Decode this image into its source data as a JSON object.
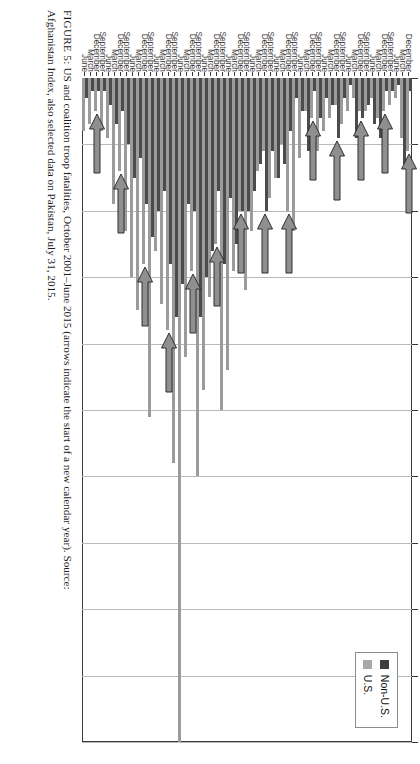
{
  "figure": {
    "caption_prefix": "FIGURE 5:",
    "caption_line1": " US and coalition troop fatalities, October 2001–June 2015 (arrows indicate the start of a new calendar year). Source:",
    "caption_line2": "Afghanistan Index, also selected data on Pakistan, July 31, 2015."
  },
  "legend": {
    "position": "top-right",
    "items": [
      {
        "label": "Non-U.S.",
        "color": "#3f3f3f",
        "key": "nonus"
      },
      {
        "label": "U.S.",
        "color": "#a7a7a7",
        "key": "us"
      }
    ]
  },
  "annotations": {
    "arrow_note": "arrows indicate the start of a new calendar year",
    "arrow_categories": [
      0,
      4,
      8,
      12,
      16,
      20,
      24,
      28,
      32,
      36,
      40,
      44,
      48,
      52
    ]
  },
  "chart_data": {
    "type": "bar",
    "orientation": "horizontal",
    "title": "US and coalition troop fatalities, October 2001–June 2015",
    "xlabel": "",
    "ylabel": "",
    "xlim": [
      0,
      100
    ],
    "xticks": [
      0,
      10,
      20,
      30,
      40,
      50,
      60,
      70,
      80,
      90,
      100
    ],
    "grid": true,
    "legend_position": "top-right",
    "categories": [
      "December",
      "March",
      "June",
      "September",
      "December",
      "March",
      "June",
      "September",
      "December",
      "March",
      "June",
      "September",
      "December",
      "March",
      "June",
      "September",
      "December",
      "March",
      "June",
      "September",
      "December",
      "March",
      "June",
      "September",
      "December",
      "March",
      "June",
      "September",
      "December",
      "March",
      "June",
      "September",
      "December",
      "March",
      "June",
      "September",
      "December",
      "March",
      "June",
      "September",
      "December",
      "March",
      "June",
      "September",
      "December",
      "March",
      "June",
      "September",
      "December",
      "March",
      "June",
      "September",
      "December",
      "March",
      "June"
    ],
    "series": [
      {
        "name": "U.S.",
        "color": "#9b9b9b",
        "values": [
          11,
          9,
          3,
          4,
          5,
          6,
          3,
          5,
          5,
          3,
          5,
          7,
          4,
          6,
          8,
          11,
          6,
          5,
          12,
          23,
          20,
          10,
          15,
          18,
          11,
          14,
          23,
          32,
          20,
          29,
          44,
          50,
          25,
          33,
          47,
          60,
          29,
          42,
          100,
          58,
          38,
          34,
          26,
          51,
          28,
          35,
          30,
          23,
          14,
          19,
          9,
          8,
          5,
          7,
          8
        ]
      },
      {
        "name": "Non-U.S.",
        "color": "#4b4b4b",
        "values": [
          2,
          13,
          1,
          2,
          2,
          9,
          7,
          4,
          6,
          9,
          1,
          3,
          9,
          4,
          3,
          6,
          2,
          11,
          5,
          3,
          8,
          13,
          15,
          11,
          20,
          13,
          17,
          20,
          20,
          25,
          18,
          28,
          17,
          26,
          30,
          36,
          20,
          19,
          31,
          36,
          28,
          17,
          20,
          24,
          19,
          12,
          15,
          10,
          5,
          7,
          4,
          2,
          2,
          2,
          3
        ]
      }
    ]
  }
}
